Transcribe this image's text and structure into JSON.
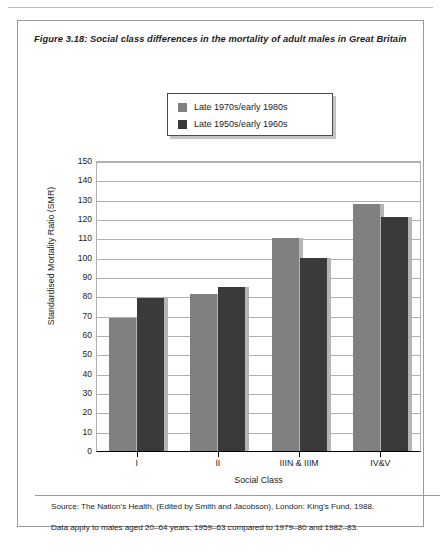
{
  "figure": {
    "number": "Figure 3.18:",
    "title": "Social class differences in the mortality of adult males in Great Britain",
    "source": "Source: The Nation's Health, (Edited by Smith and Jacobson),  London: King's Fund, 1988.",
    "note": "Data apply to males aged 20–64 years, 1959–63 compared to 1979–80 and 1982–83."
  },
  "colors": {
    "series_light": "#808080",
    "series_dark": "#3a3a3a",
    "shadow": "#b5b5b5",
    "gridline": "#b0b0b0",
    "axis": "#000000",
    "frame": "#9a9a9a"
  },
  "chart_data": {
    "type": "bar",
    "title": "Social class differences in the mortality of adult males in Great Britain",
    "xlabel": "Social Class",
    "ylabel": "Standardised Mortality Ratio (SMR)",
    "categories": [
      "I",
      "II",
      "IIIN & IIIM",
      "IV&V"
    ],
    "series": [
      {
        "name": "Late 1970s/early 1980s",
        "color": "#808080",
        "values": [
          69,
          81,
          110,
          128
        ]
      },
      {
        "name": "Late 1950s/early 1960s",
        "color": "#3a3a3a",
        "values": [
          79,
          85,
          100,
          121
        ]
      }
    ],
    "ylim": [
      0,
      150
    ],
    "ytick_step": 10,
    "yticks": [
      0,
      10,
      20,
      30,
      40,
      50,
      60,
      70,
      80,
      90,
      100,
      110,
      120,
      130,
      140,
      150
    ],
    "grid": true,
    "legend_position": "top-center"
  }
}
